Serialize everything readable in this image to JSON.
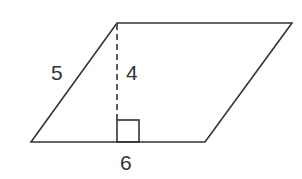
{
  "diagram": {
    "shape": "parallelogram",
    "vertices": {
      "bottom_left": [
        31,
        142
      ],
      "top_left": [
        117,
        23
      ],
      "top_right": [
        292,
        23
      ],
      "bottom_right": [
        205,
        142
      ]
    },
    "height_line": {
      "from": [
        117,
        23
      ],
      "to": [
        117,
        120
      ],
      "style": "dashed"
    },
    "right_angle_marker": {
      "x": 117,
      "y": 120,
      "size": 22
    },
    "labels": {
      "side": "5",
      "height": "4",
      "base": "6"
    },
    "colors": {
      "stroke": "#333333",
      "background": "#ffffff"
    }
  }
}
